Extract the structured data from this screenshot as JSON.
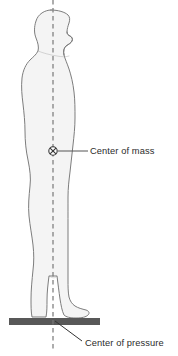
{
  "figure": {
    "background_color": "#ffffff"
  },
  "body_figure": {
    "name": "human-side-profile",
    "orientation": "facing right",
    "fill_color": "#f4f4f4",
    "outline_color": "#7d7d7d",
    "outline_width": 1
  },
  "plumb_line": {
    "name": "vertical-plumb-line",
    "style": "dashed",
    "color": "#777777",
    "x": 53,
    "y_top": 0,
    "y_bottom": 351
  },
  "center_of_mass": {
    "label": "Center of mass",
    "marker_symbol": "circled-x",
    "marker_x": 53,
    "marker_y": 151,
    "marker_color": "#333333",
    "leader_line_color": "#555555",
    "label_x": 90,
    "label_y": 154
  },
  "center_of_pressure": {
    "label": "Center of pressure",
    "point_x": 56,
    "point_y": 322,
    "leader_line_color": "#333333",
    "label_x": 85,
    "label_y": 346
  },
  "force_plate": {
    "name": "ground-force-plate",
    "color": "#585858",
    "x": 9,
    "y": 318,
    "width": 91,
    "height": 7
  },
  "colors": {
    "body_fill": "#f4f4f4",
    "body_outline": "#7d7d7d",
    "plate": "#585858",
    "dashed_line": "#777777",
    "text": "#2b2b2b",
    "background": "#ffffff"
  }
}
